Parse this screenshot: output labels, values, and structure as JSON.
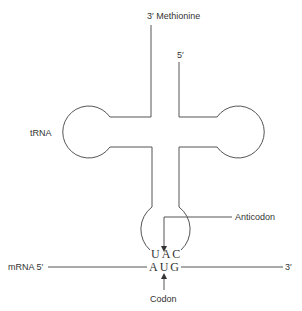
{
  "diagram": {
    "labels": {
      "methionine": "3′ Methionine",
      "five_prime_top": "5′",
      "trna": "tRNA",
      "anticodon": "Anticodon",
      "mrna_left": "mRNA 5′",
      "mrna_right": "3′",
      "codon": "Codon"
    },
    "bases": {
      "anticodon_seq": "UAC",
      "codon_seq": "AUG"
    },
    "colors": {
      "line": "#555555",
      "text": "#333333",
      "background": "#ffffff"
    }
  }
}
